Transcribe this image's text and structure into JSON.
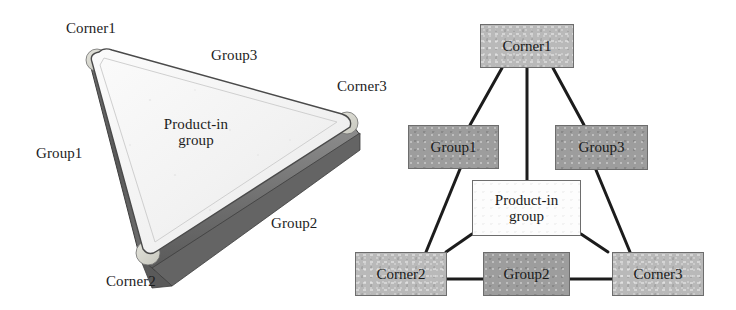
{
  "figure_3d": {
    "name": "3d-triangular-block-diagram",
    "labels": {
      "corner1": "Corner1",
      "corner2": "Corner2",
      "corner3": "Corner3",
      "group1": "Group1",
      "group2": "Group2",
      "group3": "Group3",
      "product_in_group": "Product-in\ngroup"
    },
    "colors": {
      "top_face": "#f4f4f4",
      "side_face_dark": "#5f5f5f",
      "side_face_mid": "#8a8a8a",
      "corner_fillet": "#d7d7cf",
      "outline": "#3a3a3a"
    }
  },
  "figure_graph": {
    "name": "node-link-diagram",
    "nodes": [
      {
        "id": "corner1",
        "label": "Corner1",
        "shade": "light"
      },
      {
        "id": "group1",
        "label": "Group1",
        "shade": "dark"
      },
      {
        "id": "group3",
        "label": "Group3",
        "shade": "dark"
      },
      {
        "id": "pig",
        "label": "Product-in\ngroup",
        "shade": "white"
      },
      {
        "id": "corner2",
        "label": "Corner2",
        "shade": "light"
      },
      {
        "id": "group2",
        "label": "Group2",
        "shade": "dark"
      },
      {
        "id": "corner3",
        "label": "Corner3",
        "shade": "light"
      }
    ],
    "edges": [
      {
        "from": "corner1",
        "to": "group1"
      },
      {
        "from": "corner1",
        "to": "pig"
      },
      {
        "from": "corner1",
        "to": "group3"
      },
      {
        "from": "group1",
        "to": "corner2"
      },
      {
        "from": "group1",
        "to": "pig"
      },
      {
        "from": "group3",
        "to": "corner3"
      },
      {
        "from": "group3",
        "to": "pig"
      },
      {
        "from": "pig",
        "to": "corner2"
      },
      {
        "from": "pig",
        "to": "corner3"
      },
      {
        "from": "corner2",
        "to": "group2"
      },
      {
        "from": "group2",
        "to": "corner3"
      }
    ],
    "colors": {
      "node_light": "#b9b9b9",
      "node_dark": "#9d9d9d",
      "node_white": "#fdfdfd",
      "node_border": "#6d6d6d",
      "edge": "#1c1c1c"
    }
  }
}
